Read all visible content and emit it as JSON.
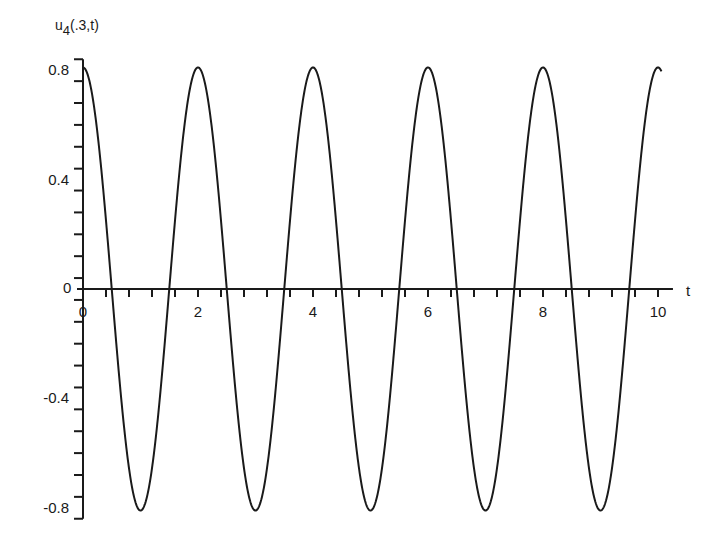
{
  "chart_data": {
    "type": "line",
    "title": "",
    "xlabel": "t",
    "ylabel": "u_4(.3,t)",
    "ylabel_main": "u",
    "ylabel_sub": "4",
    "ylabel_args": "(.3,t)",
    "xlim": [
      0,
      10
    ],
    "ylim": [
      -0.8,
      0.8
    ],
    "x_ticks": [
      0,
      2,
      4,
      6,
      8,
      10
    ],
    "x_tick_labels": [
      "0",
      "2",
      "4",
      "6",
      "8",
      "10"
    ],
    "x_minor_step": 0.4,
    "y_ticks": [
      0.8,
      0.4,
      0,
      -0.4,
      -0.8
    ],
    "y_tick_labels": [
      "0.8",
      "0.4",
      "0",
      "-0.4",
      "-0.8"
    ],
    "y_minor_step": 0.08,
    "grid": false,
    "legend": null,
    "series": [
      {
        "name": "u_4(.3,t)",
        "expression": "0.81*cos(pi*t)",
        "amplitude": 0.81,
        "period": 2,
        "x": [
          0,
          0.5,
          1,
          1.5,
          2,
          2.5,
          3,
          3.5,
          4,
          4.5,
          5,
          5.5,
          6,
          6.5,
          7,
          7.5,
          8,
          8.5,
          9,
          9.5,
          10
        ],
        "values": [
          0.81,
          0,
          -0.81,
          0,
          0.81,
          0,
          -0.81,
          0,
          0.81,
          0,
          -0.81,
          0,
          0.81,
          0,
          -0.81,
          0,
          0.81,
          0,
          -0.81,
          0,
          0.81
        ]
      }
    ],
    "line_color": "#1a1a1a"
  }
}
